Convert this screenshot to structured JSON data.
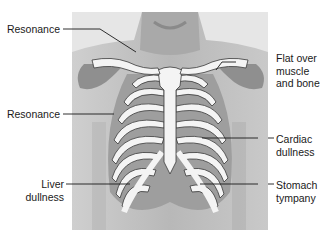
{
  "diagram": {
    "colors": {
      "background": "#ffffff",
      "skin_light": "#d9d9d9",
      "skin_mid": "#bdbdbd",
      "skin_dark": "#a8a8a8",
      "shaded_region": "#8f8f8f",
      "bone": "#f4f4f4",
      "bone_outline": "#3a3a3a",
      "leader_line": "#1a1a1a"
    },
    "labels": [
      {
        "id": "resonance-upper",
        "lines": [
          "Resonance"
        ],
        "side": "left"
      },
      {
        "id": "resonance-mid",
        "lines": [
          "Resonance"
        ],
        "side": "left"
      },
      {
        "id": "liver-dullness",
        "lines": [
          "Liver",
          "dullness"
        ],
        "side": "left"
      },
      {
        "id": "flat-over-muscle-bone",
        "lines": [
          "Flat over",
          "muscle",
          "and bone"
        ],
        "side": "right"
      },
      {
        "id": "cardiac-dullness",
        "lines": [
          "Cardiac",
          "dullness"
        ],
        "side": "right"
      },
      {
        "id": "stomach-tympany",
        "lines": [
          "Stomach",
          "tympany"
        ],
        "side": "right"
      }
    ]
  }
}
